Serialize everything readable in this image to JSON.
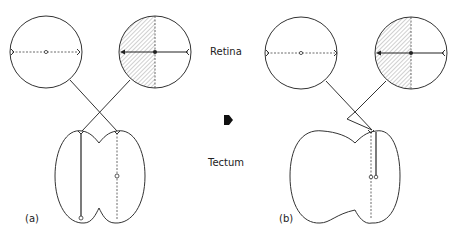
{
  "labels": {
    "retina": "Retina",
    "tectum": "Tectum",
    "panel_a": "(a)",
    "panel_b": "(b)"
  },
  "panels": [
    {
      "id": "a",
      "description": "Normal retinotectal projection: left retina (dashed axis) and right retina (hatched half, solid arrowed axis) cross-project to opposite tectal lobes"
    },
    {
      "id": "b",
      "description": "Both retinal projections converge onto a single tectal lobe"
    }
  ],
  "center_arrow": "right-pointing arrowhead",
  "colors": {
    "line": "#333333",
    "hatch": "#888888",
    "background": "#ffffff"
  }
}
